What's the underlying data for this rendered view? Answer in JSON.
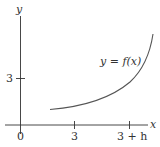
{
  "figure": {
    "axes": {
      "x_label": "x",
      "y_label": "y",
      "origin_label": "0",
      "x_ticks": [
        "3",
        "3 + h"
      ],
      "y_ticks": [
        "3"
      ]
    },
    "curve": {
      "label": "y = f(x)",
      "description": "increasing, concave-up curve"
    },
    "colors": {
      "axis": "#333333",
      "curve": "#555555",
      "text": "#333333"
    }
  }
}
